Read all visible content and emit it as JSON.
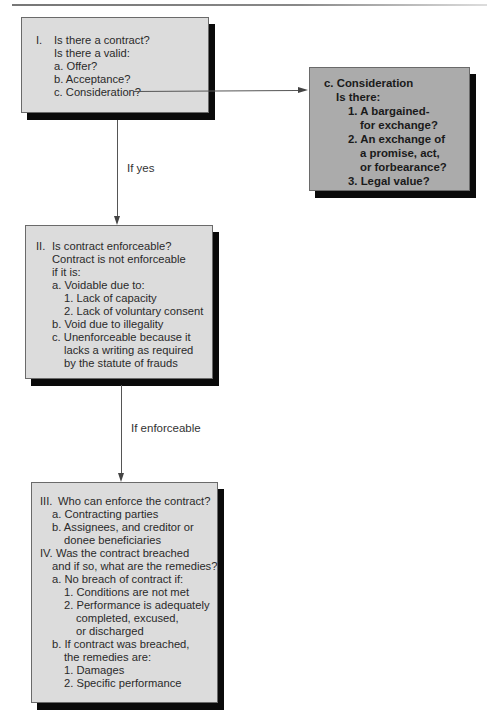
{
  "box1": {
    "lines": [
      {
        "num": "I.",
        "text": "Is there a contract?"
      },
      {
        "text": "Is there a valid:"
      },
      {
        "text": "a. Offer?"
      },
      {
        "text": "b. Acceptance?"
      },
      {
        "text": "c. Consideration?"
      }
    ]
  },
  "box_consideration": {
    "lines": [
      {
        "text": "c. Consideration"
      },
      {
        "text": "Is there:"
      },
      {
        "text": "1. A bargained-"
      },
      {
        "text": "for exchange?"
      },
      {
        "text": "2. An exchange of"
      },
      {
        "text": "a promise, act,"
      },
      {
        "text": "or forbearance?"
      },
      {
        "text": "3. Legal value?"
      }
    ]
  },
  "connector1": {
    "label": "If yes"
  },
  "box2": {
    "lines": [
      {
        "num": "II.",
        "text": "Is contract enforceable?"
      },
      {
        "text": "Contract is not enforceable"
      },
      {
        "text": "if it is:"
      },
      {
        "text": "a. Voidable due to:"
      },
      {
        "text": "1. Lack of capacity"
      },
      {
        "text": "2. Lack of voluntary consent"
      },
      {
        "text": "b. Void due to illegality"
      },
      {
        "text": "c. Unenforceable because it"
      },
      {
        "text": "lacks a writing as required"
      },
      {
        "text": "by the statute of frauds"
      }
    ]
  },
  "connector2": {
    "label": "If enforceable"
  },
  "box3": {
    "lines": [
      {
        "num": "III.",
        "text": "Who can enforce the contract?"
      },
      {
        "text": "a. Contracting parties"
      },
      {
        "text": "b. Assignees, and creditor or"
      },
      {
        "text": "donee beneficiaries"
      },
      {
        "num": "IV.",
        "text": "Was the contract breached"
      },
      {
        "text": "and if so, what are the remedies?"
      },
      {
        "text": "a. No breach of contract if:"
      },
      {
        "text": "1. Conditions are not met"
      },
      {
        "text": "2. Performance is adequately"
      },
      {
        "text": "completed, excused,"
      },
      {
        "text": "or discharged"
      },
      {
        "text": "b. If contract was breached,"
      },
      {
        "text": "the remedies are:"
      },
      {
        "text": "1. Damages"
      },
      {
        "text": "2. Specific performance"
      }
    ]
  },
  "colors": {
    "box_light": "#dcdcdc",
    "box_dark": "#ababab",
    "shadow": "#0a0a0a",
    "line": "#555555"
  }
}
